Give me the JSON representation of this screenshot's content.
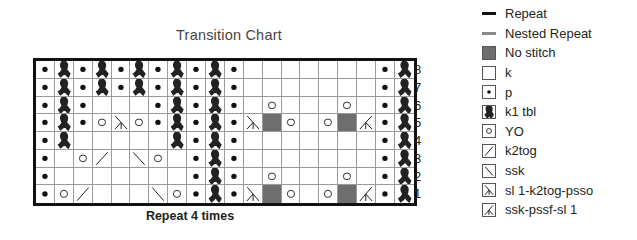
{
  "chart_data": {
    "type": "table",
    "title": "Transition Chart",
    "footer": "Repeat 4 times",
    "columns": 20,
    "row_numbers": [
      "8",
      "7",
      "6",
      "5",
      "4",
      "3",
      "2",
      "1"
    ],
    "rows_top_to_bottom": [
      [
        "p",
        "tbl",
        "p",
        "tbl",
        "p",
        "tbl",
        "p",
        "tbl",
        "p",
        "tbl",
        "p",
        "k",
        "k",
        "k",
        "k",
        "k",
        "k",
        "k",
        "p",
        "tbl"
      ],
      [
        "p",
        "tbl",
        "p",
        "tbl",
        "p",
        "tbl",
        "p",
        "tbl",
        "p",
        "tbl",
        "p",
        "k",
        "k",
        "k",
        "k",
        "k",
        "k",
        "k",
        "p",
        "tbl"
      ],
      [
        "p",
        "tbl",
        "p",
        "k",
        "k",
        "k",
        "p",
        "tbl",
        "p",
        "tbl",
        "p",
        "k",
        "yo",
        "k",
        "k",
        "k",
        "yo",
        "k",
        "p",
        "tbl"
      ],
      [
        "p",
        "tbl",
        "p",
        "yo",
        "s2p",
        "yo",
        "p",
        "tbl",
        "p",
        "tbl",
        "p",
        "s2p",
        "ns",
        "yo",
        "k",
        "yo",
        "ns",
        "sssp",
        "p",
        "tbl"
      ],
      [
        "p",
        "tbl",
        "k",
        "k",
        "k",
        "k",
        "k",
        "tbl",
        "p",
        "tbl",
        "p",
        "k",
        "k",
        "k",
        "k",
        "k",
        "k",
        "k",
        "p",
        "tbl"
      ],
      [
        "p",
        "k",
        "yo",
        "k2tog",
        "k",
        "ssk",
        "yo",
        "k",
        "p",
        "tbl",
        "p",
        "k",
        "k",
        "k",
        "k",
        "k",
        "k",
        "k",
        "p",
        "tbl"
      ],
      [
        "p",
        "k",
        "k",
        "k",
        "k",
        "k",
        "k",
        "k",
        "p",
        "tbl",
        "p",
        "k",
        "yo",
        "k",
        "k",
        "k",
        "yo",
        "k",
        "p",
        "tbl"
      ],
      [
        "p",
        "yo",
        "k2tog",
        "k",
        "k",
        "k",
        "ssk",
        "yo",
        "p",
        "tbl",
        "p",
        "s2p",
        "ns",
        "yo",
        "k",
        "yo",
        "ns",
        "sssp",
        "p",
        "tbl"
      ]
    ],
    "colors": {
      "grid": "#9a9a9a",
      "border": "#111111",
      "no_stitch": "#6e6e6e"
    }
  },
  "legend": [
    {
      "key": "repeat",
      "label": "Repeat",
      "kind": "line",
      "color": "#111111"
    },
    {
      "key": "nested",
      "label": "Nested Repeat",
      "kind": "line",
      "color": "#8a8a8a"
    },
    {
      "key": "ns",
      "label": "No stitch",
      "kind": "fill"
    },
    {
      "key": "k",
      "label": "k",
      "kind": "box"
    },
    {
      "key": "p",
      "label": "p",
      "kind": "box"
    },
    {
      "key": "tbl",
      "label": "k1 tbl",
      "kind": "box"
    },
    {
      "key": "yo",
      "label": "YO",
      "kind": "box"
    },
    {
      "key": "k2tog",
      "label": "k2tog",
      "kind": "box"
    },
    {
      "key": "ssk",
      "label": "ssk",
      "kind": "box"
    },
    {
      "key": "s2p",
      "label": "sl 1-k2tog-psso",
      "kind": "box"
    },
    {
      "key": "sssp",
      "label": "ssk-pssf-sl 1",
      "kind": "box"
    }
  ]
}
